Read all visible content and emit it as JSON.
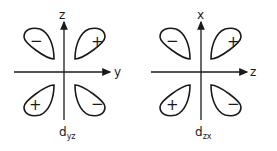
{
  "diagrams": [
    {
      "name": "d_yz",
      "label_main": "d",
      "label_sub": "yz",
      "vertical_axis": "z",
      "horizontal_axis": "y",
      "lobes": {
        "upper_left": "−",
        "upper_right": "+",
        "lower_left": "+",
        "lower_right": "−"
      }
    },
    {
      "name": "d_zx",
      "label_main": "d",
      "label_sub": "zx",
      "vertical_axis": "x",
      "horizontal_axis": "z",
      "lobes": {
        "upper_left": "−",
        "upper_right": "+",
        "lower_left": "+",
        "lower_right": "−"
      }
    }
  ],
  "colors": {
    "ink": "#1a1a1a",
    "background": "#ffffff"
  }
}
